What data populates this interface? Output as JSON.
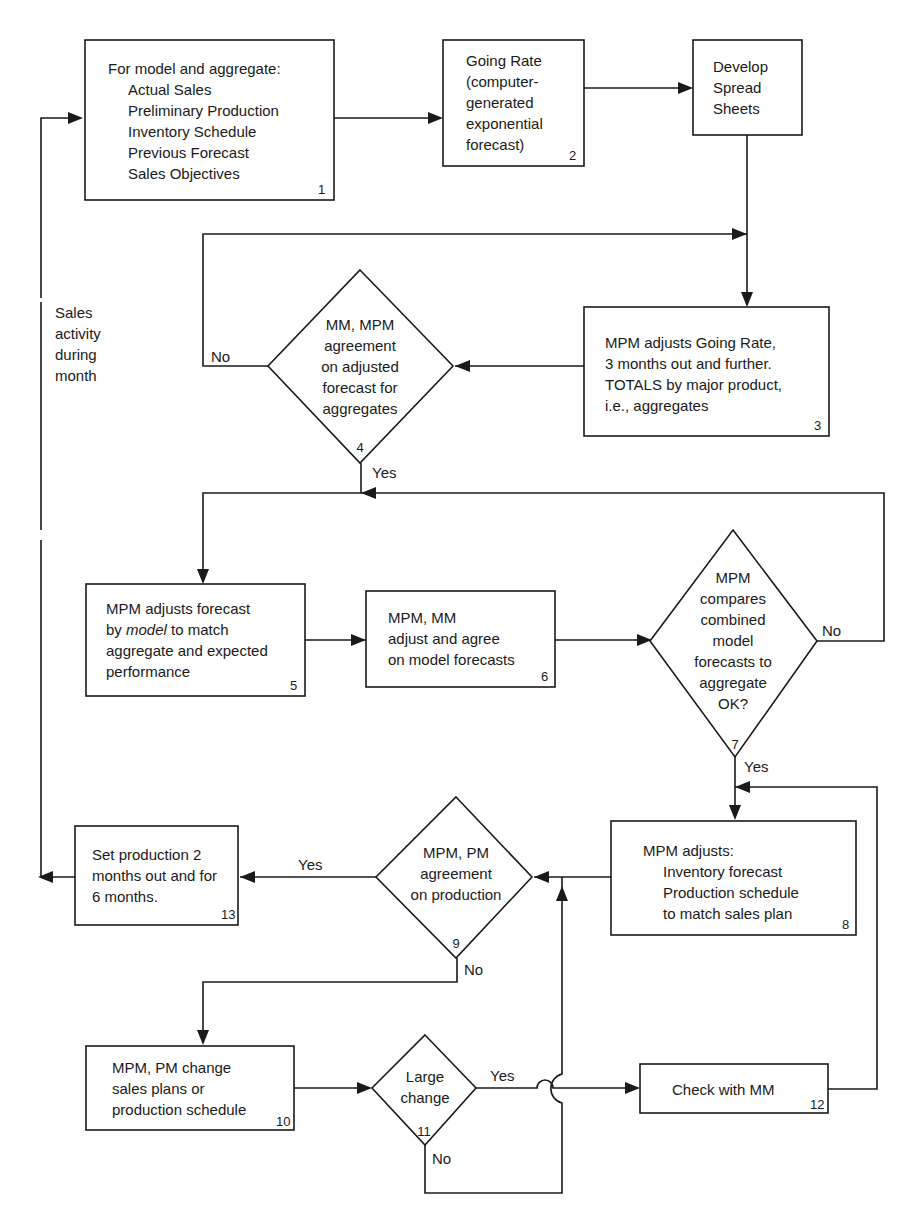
{
  "diagram": {
    "nodes": {
      "n1": {
        "number": "1",
        "lines": [
          "For model and aggregate:",
          "Actual Sales",
          "Preliminary Production",
          "Inventory Schedule",
          "Previous Forecast",
          "Sales Objectives"
        ]
      },
      "n2": {
        "number": "2",
        "lines": [
          "Going Rate",
          "(computer-",
          "generated",
          "exponential",
          "forecast)"
        ]
      },
      "spread": {
        "lines": [
          "Develop",
          "Spread",
          "Sheets"
        ]
      },
      "n3": {
        "number": "3",
        "lines": [
          "MPM adjusts Going Rate,",
          "3 months out and further.",
          "TOTALS by major product,",
          "i.e., aggregates"
        ]
      },
      "n4": {
        "number": "4",
        "lines": [
          "MM, MPM",
          "agreement",
          "on adjusted",
          "forecast for",
          "aggregates"
        ]
      },
      "n5": {
        "number": "5",
        "lines": [
          "MPM adjusts forecast",
          "by",
          "model",
          "to match",
          "aggregate and expected",
          "performance"
        ]
      },
      "n6": {
        "number": "6",
        "lines": [
          "MPM, MM",
          "adjust and agree",
          "on model forecasts"
        ]
      },
      "n7": {
        "number": "7",
        "lines": [
          "MPM",
          "compares",
          "combined",
          "model",
          "forecasts to",
          "aggregate",
          "OK?"
        ]
      },
      "n8": {
        "number": "8",
        "lines": [
          "MPM adjusts:",
          "Inventory forecast",
          "Production schedule",
          "to match sales plan"
        ]
      },
      "n9": {
        "number": "9",
        "lines": [
          "MPM, PM",
          "agreement",
          "on production"
        ]
      },
      "n10": {
        "number": "10",
        "lines": [
          "MPM, PM change",
          "sales plans or",
          "production schedule"
        ]
      },
      "n11": {
        "number": "11",
        "lines": [
          "Large",
          "change"
        ]
      },
      "n12": {
        "number": "12",
        "lines": [
          "Check with MM"
        ]
      },
      "n13": {
        "number": "13",
        "lines": [
          "Set production 2",
          "months out and for",
          "6 months."
        ]
      }
    },
    "labels": {
      "sales_activity": [
        "Sales",
        "activity",
        "during",
        "month"
      ],
      "no": "No",
      "yes": "Yes"
    }
  }
}
